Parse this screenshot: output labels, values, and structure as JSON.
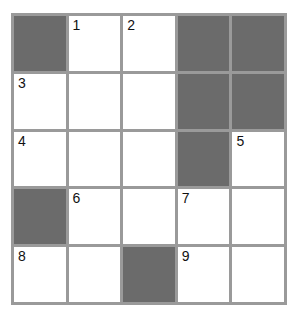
{
  "puzzle": {
    "rows": 5,
    "cols": 5,
    "colors": {
      "grid_line": "#9a9a9a",
      "block": "#6b6b6b",
      "cell": "#ffffff",
      "number": "#111111"
    },
    "cells": [
      [
        {
          "block": true
        },
        {
          "number": "1"
        },
        {
          "number": "2"
        },
        {
          "block": true
        },
        {
          "block": true
        }
      ],
      [
        {
          "number": "3"
        },
        {},
        {},
        {
          "block": true
        },
        {
          "block": true
        }
      ],
      [
        {
          "number": "4"
        },
        {},
        {},
        {
          "block": true
        },
        {
          "number": "5"
        }
      ],
      [
        {
          "block": true
        },
        {
          "number": "6"
        },
        {},
        {
          "number": "7"
        },
        {}
      ],
      [
        {
          "number": "8"
        },
        {},
        {
          "block": true
        },
        {
          "number": "9"
        },
        {}
      ]
    ]
  }
}
